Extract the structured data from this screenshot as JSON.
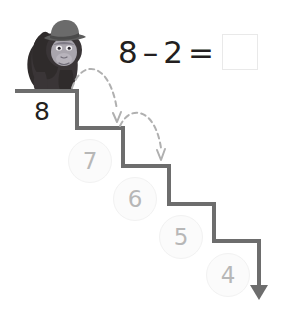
{
  "page": {
    "background_color": "#ffffff"
  },
  "equation": {
    "minuend": "8",
    "operator_minus": "–",
    "subtrahend": "2",
    "operator_equals": "=",
    "answer_value": "",
    "answer_placeholder": ""
  },
  "colors": {
    "stair_line": "#6d6d6d",
    "dashed_arc": "#b0b0b0",
    "number_faded": "#b7b7b7",
    "number_dark": "#231f20",
    "circle_fill": "#fbfbfb",
    "circle_stroke": "#f2f2f2",
    "answer_box_border": "#e9e9e9",
    "gorilla_body": "#2f2b2b",
    "gorilla_face": "#a9a5ad",
    "gorilla_hat": "#5c5c5c"
  },
  "staircase": {
    "steps": [
      {
        "label": "8",
        "style": "dark",
        "cx": 42,
        "cy": 111,
        "circled": false
      },
      {
        "label": "7",
        "style": "faded",
        "cx": 90,
        "cy": 161,
        "circled": true
      },
      {
        "label": "6",
        "style": "faded",
        "cx": 135,
        "cy": 199,
        "circled": true
      },
      {
        "label": "5",
        "style": "faded",
        "cx": 181,
        "cy": 237,
        "circled": true
      },
      {
        "label": "4",
        "style": "faded",
        "cx": 228,
        "cy": 275,
        "circled": true
      }
    ]
  },
  "hops": [
    {
      "name": "hop-8-to-7",
      "from_label": "8",
      "to_label": "7"
    },
    {
      "name": "hop-7-to-6",
      "from_label": "7",
      "to_label": "6"
    }
  ],
  "character": {
    "name": "gorilla",
    "accessory": "hat",
    "position_label": "top-step"
  },
  "direction_arrow": {
    "name": "downward-arrow",
    "direction": "down"
  }
}
